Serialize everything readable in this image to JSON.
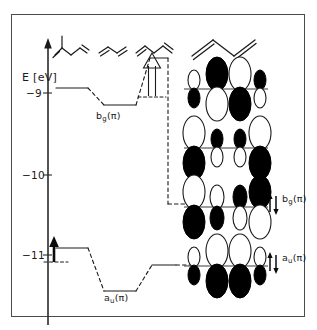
{
  "figure": {
    "domain": "scientific-orbital-energy-diagram",
    "width": 317,
    "height": 330,
    "background": "#ffffff",
    "border_color": "#4a4a4a",
    "ink_color": "#1a1a1a"
  },
  "axis": {
    "title": "E [eV]",
    "unit": "eV",
    "quantity": "E",
    "orientation": "vertical",
    "arrow_at": "top",
    "ticks": [
      {
        "label": "−9",
        "value": -9,
        "y_px": 93
      },
      {
        "label": "−10",
        "value": -10,
        "y_px": 175
      },
      {
        "label": "−11",
        "value": -11,
        "y_px": 255
      }
    ],
    "range": [
      -11.8,
      -8.5
    ]
  },
  "molecules": [
    {
      "name": "isoprene-skeleton",
      "label": "",
      "position": "top-left"
    },
    {
      "name": "butadiene-skeleton-a",
      "label": "",
      "position": "top-left-center"
    },
    {
      "name": "butadiene-skeleton-b",
      "label": "",
      "position": "top-center"
    },
    {
      "name": "butadiene-skeleton-large",
      "label": "",
      "position": "top-right"
    }
  ],
  "correlation_levels": {
    "upper_series": {
      "symmetry_label": "b",
      "symmetry_sub": "g",
      "symmetry_pi": "(π)",
      "label_text": "b",
      "segments": [
        {
          "name": "level-bg-1",
          "energy": -8.9,
          "x0": 40,
          "x1": 72
        },
        {
          "name": "level-bg-2",
          "energy": -9.12,
          "x0": 92,
          "x1": 124
        },
        {
          "name": "level-bg-3",
          "energy": -8.55,
          "x0": 140,
          "x1": 166
        },
        {
          "name": "level-bg-final",
          "energy": -10.33,
          "x0": 166,
          "x1": 198
        }
      ]
    },
    "lower_series": {
      "symmetry_label": "a",
      "symmetry_sub": "u",
      "symmetry_pi": "(π)",
      "segments": [
        {
          "name": "level-au-1",
          "energy": -10.95,
          "x0": 40,
          "x1": 72
        },
        {
          "name": "level-au-2",
          "energy": -11.55,
          "x0": 92,
          "x1": 124
        },
        {
          "name": "level-au-3",
          "energy": -11.12,
          "x0": 140,
          "x1": 198
        }
      ]
    }
  },
  "arrows": [
    {
      "name": "filled-shift-arrow",
      "style": "solid-filled",
      "direction": "up",
      "x_px": 53,
      "y_bottom": 268,
      "y_top": 246
    },
    {
      "name": "hollow-shift-arrow",
      "style": "open-outline",
      "direction": "up",
      "x_px": 152,
      "y_bottom": 97,
      "y_top": 56
    }
  ],
  "electron_occupancies": [
    {
      "name": "electron-pair-bg",
      "label_main": "b",
      "label_sub": "g",
      "label_pi": "(π)",
      "electrons": 2,
      "y_px": 203
    },
    {
      "name": "electron-pair-au",
      "label_main": "a",
      "label_sub": "u",
      "label_pi": "(π)",
      "electrons": 2,
      "y_px": 262
    }
  ],
  "orbital_diagrams": [
    {
      "name": "mo-psi4",
      "index": 4,
      "nodes": 3,
      "y_axis_px": 89,
      "lobes": [
        {
          "x": 194,
          "size": "small",
          "up": "white",
          "down": "black"
        },
        {
          "x": 217,
          "size": "large",
          "up": "black",
          "down": "white"
        },
        {
          "x": 240,
          "size": "large",
          "up": "white",
          "down": "black"
        },
        {
          "x": 260,
          "size": "small",
          "up": "black",
          "down": "white"
        }
      ]
    },
    {
      "name": "mo-psi3",
      "index": 3,
      "nodes": 2,
      "y_axis_px": 148,
      "lobes": [
        {
          "x": 194,
          "size": "large",
          "up": "white",
          "down": "black"
        },
        {
          "x": 217,
          "size": "small",
          "up": "black",
          "down": "white"
        },
        {
          "x": 240,
          "size": "small",
          "up": "black",
          "down": "white"
        },
        {
          "x": 260,
          "size": "large",
          "up": "white",
          "down": "black"
        }
      ]
    },
    {
      "name": "mo-psi2-bg",
      "index": 2,
      "nodes": 1,
      "y_axis_px": 207,
      "lobes": [
        {
          "x": 194,
          "size": "large",
          "up": "white",
          "down": "black"
        },
        {
          "x": 217,
          "size": "small",
          "up": "white",
          "down": "black"
        },
        {
          "x": 240,
          "size": "small",
          "up": "black",
          "down": "white"
        },
        {
          "x": 260,
          "size": "large",
          "up": "black",
          "down": "white"
        }
      ]
    },
    {
      "name": "mo-psi1-au",
      "index": 1,
      "nodes": 0,
      "y_axis_px": 266,
      "lobes": [
        {
          "x": 194,
          "size": "small",
          "up": "white",
          "down": "black"
        },
        {
          "x": 217,
          "size": "large",
          "up": "white",
          "down": "black"
        },
        {
          "x": 240,
          "size": "large",
          "up": "white",
          "down": "black"
        },
        {
          "x": 260,
          "size": "small",
          "up": "white",
          "down": "black"
        }
      ]
    }
  ],
  "colors": {
    "line": "#1a1a1a",
    "lobe_fill_dark": "#000000",
    "lobe_fill_light": "#ffffff",
    "frame": "#4a4a4a",
    "axis": "#2a2a2a"
  }
}
